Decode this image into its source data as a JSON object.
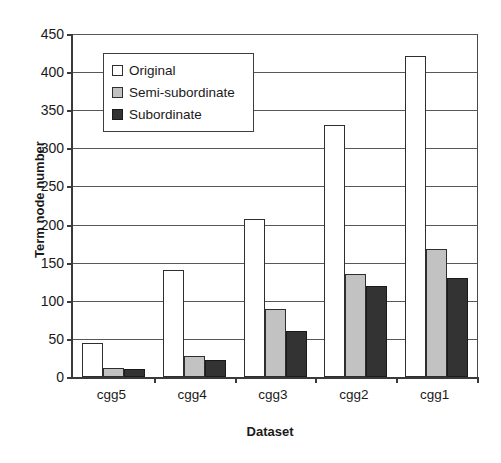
{
  "chart_data": {
    "type": "bar",
    "title": "",
    "xlabel": "Dataset",
    "ylabel": "Term node number",
    "categories": [
      "cgg5",
      "cgg4",
      "cgg3",
      "cgg2",
      "cgg1"
    ],
    "series": [
      {
        "name": "Original",
        "values": [
          45,
          140,
          207,
          331,
          421
        ],
        "color": "#ffffff"
      },
      {
        "name": "Semi-subordinate",
        "values": [
          12,
          28,
          89,
          135,
          168
        ],
        "color": "#c2c2c2"
      },
      {
        "name": "Subordinate",
        "values": [
          11,
          22,
          60,
          120,
          130
        ],
        "color": "#333333"
      }
    ],
    "ylim": [
      0,
      450
    ],
    "ytick_step": 50,
    "yticks": [
      0,
      50,
      100,
      150,
      200,
      250,
      300,
      350,
      400,
      450
    ],
    "ytick_labels": [
      "0",
      "50",
      "100",
      "150",
      "200",
      "250",
      "300",
      "350",
      "400",
      "450"
    ],
    "grid": true,
    "grid_axis": "y",
    "legend_position": "upper left",
    "axis_color": "#3a3a3a",
    "grid_color": "#585858"
  }
}
